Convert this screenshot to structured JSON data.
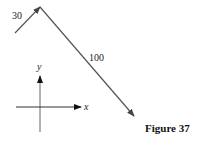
{
  "figure": {
    "caption": "Figure 37"
  },
  "vectors": [
    {
      "label": "30",
      "from": [
        15,
        33
      ],
      "to": [
        40,
        7
      ],
      "color": "#555555"
    },
    {
      "label": "100",
      "from": [
        40,
        7
      ],
      "to": [
        134,
        116
      ],
      "color": "#555555"
    }
  ],
  "axes": {
    "x_label": "x",
    "y_label": "y",
    "origin": [
      40,
      107
    ],
    "color": "#333333"
  }
}
